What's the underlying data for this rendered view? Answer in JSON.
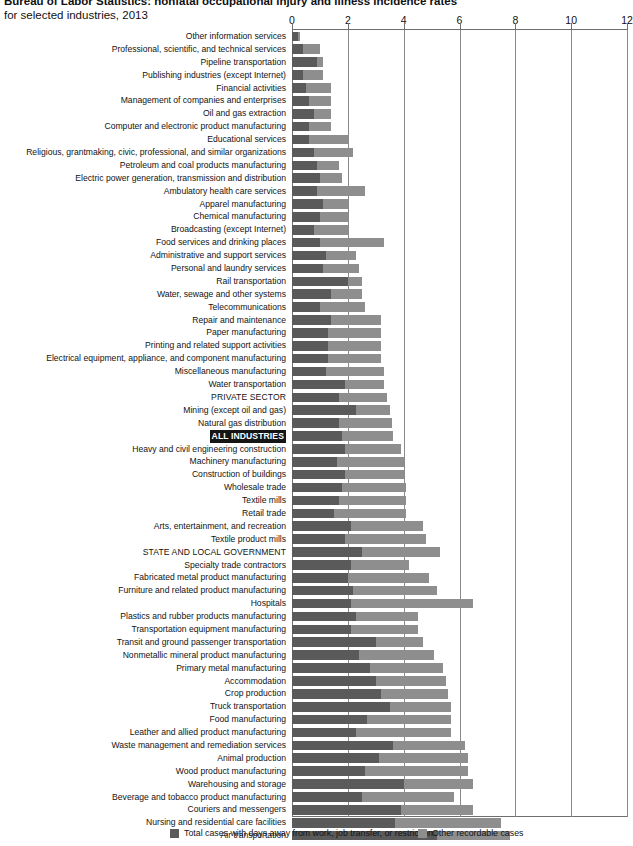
{
  "title": {
    "line1": "Bureau of Labor Statistics: nonfatal occupational injury and illness incidence rates",
    "line2": "for selected industries, 2013"
  },
  "legend": {
    "items": [
      {
        "label": "Total cases with days away from work, job transfer, or restriction",
        "color": "#5a5a5a"
      },
      {
        "label": "Other recordable cases",
        "color": "#8e8e8e"
      }
    ]
  },
  "chart_data": {
    "type": "bar",
    "orientation": "horizontal",
    "stacked": true,
    "title": "Bureau of Labor Statistics: nonfatal occupational injury and illness incidence rates for selected industries, 2013",
    "xlabel": "",
    "ylabel": "",
    "xlim": [
      0,
      12
    ],
    "xticks": [
      0,
      2,
      4,
      6,
      8,
      10,
      12
    ],
    "grid": true,
    "legend_position": "bottom",
    "series": [
      {
        "name": "Total cases with days away from work, job transfer, or restriction",
        "color": "#5a5a5a"
      },
      {
        "name": "Other recordable cases",
        "color": "#8e8e8e"
      }
    ],
    "categories": [
      "Other information services",
      "Professional, scientific, and technical services",
      "Pipeline transportation",
      "Publishing industries (except Internet)",
      "Financial activities",
      "Management of companies and enterprises",
      "Oil and gas extraction",
      "Computer and electronic product manufacturing",
      "Educational services",
      "Religious, grantmaking, civic, professional, and similar organizations",
      "Petroleum and coal products manufacturing",
      "Electric power generation, transmission and distribution",
      "Ambulatory health care services",
      "Apparel manufacturing",
      "Chemical manufacturing",
      "Broadcasting (except Internet)",
      "Food services and drinking places",
      "Administrative and support services",
      "Personal and laundry services",
      "Rail transportation",
      "Water, sewage and other systems",
      "Telecommunications",
      "Repair and maintenance",
      "Paper manufacturing",
      "Printing and related support activities",
      "Electrical equipment, appliance, and component manufacturing",
      "Miscellaneous manufacturing",
      "Water transportation",
      "PRIVATE SECTOR",
      "Mining (except oil and gas)",
      "Natural gas distribution",
      "ALL INDUSTRIES",
      "Heavy and civil engineering construction",
      "Machinery manufacturing",
      "Construction of buildings",
      "Wholesale trade",
      "Textile mills",
      "Retail trade",
      "Arts, entertainment, and recreation",
      "Textile product mills",
      "STATE AND LOCAL GOVERNMENT",
      "Specialty trade contractors",
      "Fabricated metal product manufacturing",
      "Furniture and related product manufacturing",
      "Hospitals",
      "Plastics and rubber products manufacturing",
      "Transportation equipment manufacturing",
      "Transit and ground passenger transportation",
      "Nonmetallic mineral product manufacturing",
      "Primary metal manufacturing",
      "Accommodation",
      "Crop production",
      "Truck transportation",
      "Food manufacturing",
      "Leather and allied product manufacturing",
      "Waste management and remediation services",
      "Animal production",
      "Wood product manufacturing",
      "Warehousing and storage",
      "Beverage and tobacco product manufacturing",
      "Couriers and messengers",
      "Nursing and residential care facilities",
      "Air transportation"
    ],
    "values": {
      "days_away_job_transfer_restriction": [
        0.2,
        0.4,
        0.9,
        0.4,
        0.5,
        0.6,
        0.8,
        0.6,
        0.6,
        0.8,
        0.9,
        1.0,
        0.9,
        1.1,
        1.0,
        0.8,
        1.0,
        1.2,
        1.1,
        2.0,
        1.4,
        1.0,
        1.4,
        1.3,
        1.3,
        1.3,
        1.2,
        1.9,
        1.7,
        2.3,
        1.7,
        1.8,
        1.9,
        1.6,
        1.9,
        1.8,
        1.7,
        1.5,
        2.1,
        1.9,
        2.5,
        2.1,
        2.0,
        2.2,
        2.1,
        2.3,
        2.1,
        3.0,
        2.4,
        2.8,
        3.0,
        3.2,
        3.5,
        2.7,
        2.3,
        3.6,
        3.1,
        2.6,
        4.0,
        2.5,
        3.9,
        3.7,
        5.2
      ],
      "other_recordable_cases": [
        0.1,
        0.6,
        0.2,
        0.7,
        0.9,
        0.8,
        0.6,
        0.8,
        1.4,
        1.4,
        0.8,
        0.8,
        1.7,
        0.9,
        1.0,
        1.2,
        2.3,
        1.1,
        1.3,
        0.5,
        1.1,
        1.6,
        1.8,
        1.9,
        1.9,
        1.9,
        2.1,
        1.4,
        1.7,
        1.2,
        1.9,
        1.8,
        2.0,
        2.4,
        2.1,
        2.3,
        2.4,
        2.6,
        2.6,
        2.9,
        2.8,
        2.1,
        2.9,
        3.0,
        4.4,
        2.2,
        2.4,
        1.7,
        2.7,
        2.6,
        2.5,
        2.4,
        2.2,
        3.0,
        3.4,
        2.6,
        3.2,
        3.7,
        2.5,
        3.3,
        2.6,
        3.8,
        2.6
      ]
    },
    "highlighted_category": "ALL INDUSTRIES",
    "emphasis_categories": [
      "PRIVATE SECTOR",
      "ALL INDUSTRIES",
      "STATE AND LOCAL GOVERNMENT"
    ]
  }
}
